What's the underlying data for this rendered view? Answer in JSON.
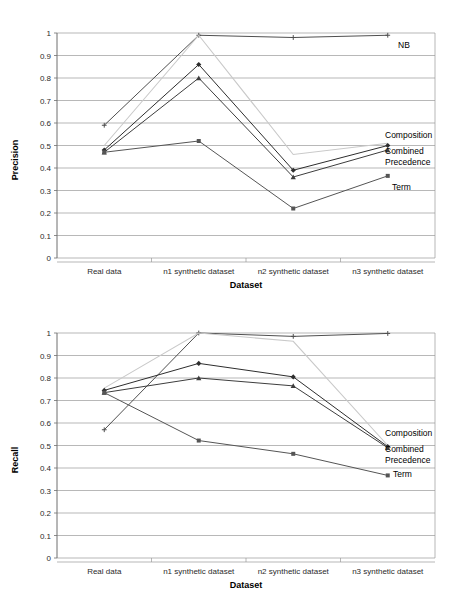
{
  "chart_data": [
    {
      "type": "line",
      "title": "",
      "xlabel": "Dataset",
      "ylabel": "Precision",
      "ylim": [
        0,
        1
      ],
      "yticks": [
        "0",
        "0.1",
        "0.2",
        "0.3",
        "0.4",
        "0.5",
        "0.6",
        "0.7",
        "0.8",
        "0.9",
        "1"
      ],
      "grid": true,
      "legend_position": "right-inline-annotations",
      "categories": [
        "Real data",
        "n1 synthetic dataset",
        "n2 synthetic dataset",
        "n3 synthetic dataset"
      ],
      "series": [
        {
          "name": "NB",
          "values": [
            0.59,
            0.99,
            0.98,
            0.99
          ],
          "color": "#4f4f4f",
          "marker": "cross"
        },
        {
          "name": "Composition",
          "values": [
            0.5,
            0.99,
            0.46,
            0.51
          ],
          "color": "#c9c9c9",
          "marker": "none"
        },
        {
          "name": "Combined",
          "values": [
            0.48,
            0.86,
            0.39,
            0.5
          ],
          "color": "#2d2d2d",
          "marker": "diamond"
        },
        {
          "name": "Precedence",
          "values": [
            0.47,
            0.8,
            0.36,
            0.48
          ],
          "color": "#3d3d3d",
          "marker": "triangle"
        },
        {
          "name": "Term",
          "values": [
            0.47,
            0.52,
            0.22,
            0.365
          ],
          "color": "#555555",
          "marker": "square"
        }
      ]
    },
    {
      "type": "line",
      "title": "",
      "xlabel": "Dataset",
      "ylabel": "Recall",
      "ylim": [
        0,
        1
      ],
      "yticks": [
        "0",
        "0.1",
        "0.2",
        "0.3",
        "0.4",
        "0.5",
        "0.6",
        "0.7",
        "0.8",
        "0.9",
        "1"
      ],
      "grid": true,
      "legend_position": "right-inline-annotations",
      "categories": [
        "Real data",
        "n1 synthetic dataset",
        "n2 synthetic dataset",
        "n3 synthetic dataset"
      ],
      "series": [
        {
          "name": "NB",
          "values": [
            0.57,
            1.0,
            0.985,
            0.998
          ],
          "color": "#4f4f4f",
          "marker": "cross"
        },
        {
          "name": "Composition",
          "values": [
            0.755,
            1.0,
            0.963,
            0.5
          ],
          "color": "#c9c9c9",
          "marker": "none"
        },
        {
          "name": "Combined",
          "values": [
            0.745,
            0.865,
            0.805,
            0.495
          ],
          "color": "#2d2d2d",
          "marker": "diamond"
        },
        {
          "name": "Precedence",
          "values": [
            0.735,
            0.8,
            0.765,
            0.49
          ],
          "color": "#3d3d3d",
          "marker": "triangle"
        },
        {
          "name": "Term",
          "values": [
            0.735,
            0.522,
            0.463,
            0.367
          ],
          "color": "#555555",
          "marker": "square"
        }
      ]
    }
  ],
  "precision_chart": {
    "ylabel": "Precision",
    "xlabel": "Dataset",
    "annotations": {
      "nb": "NB",
      "composition": "Composition",
      "combined": "Combined",
      "precedence": "Precedence",
      "term": "Term"
    }
  },
  "recall_chart": {
    "ylabel": "Recall",
    "xlabel": "Dataset",
    "annotations": {
      "nb": "NB",
      "composition": "Composition",
      "combined": "Combined",
      "precedence": "Precedence",
      "term": "Term"
    }
  }
}
